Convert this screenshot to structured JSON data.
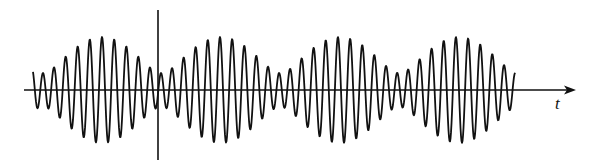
{
  "figure": {
    "x_axis_label": "t",
    "colors": {
      "stroke": "#111111",
      "background": "#ffffff"
    }
  },
  "axes": {
    "horizontal": {
      "x_start": 24,
      "x_end": 576,
      "y": 90
    },
    "vertical": {
      "x": 158,
      "y_top": 10,
      "y_bottom": 160
    }
  },
  "waveform": {
    "x_start": 33,
    "x_end": 515,
    "baseline_y": 90,
    "components": [
      {
        "amplitude": 35,
        "period_px": 11.8
      },
      {
        "amplitude": 18,
        "period_px": 13.1
      }
    ],
    "envelope_max_x": [
      102,
      220,
      337,
      456
    ],
    "envelope_min_x": [
      158,
      275,
      393,
      512
    ]
  }
}
